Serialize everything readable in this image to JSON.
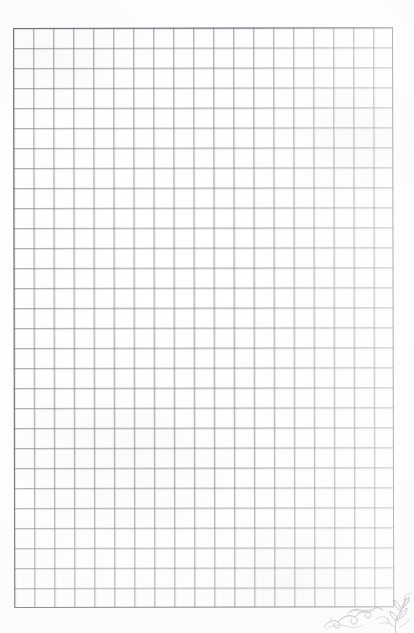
{
  "document": {
    "kind": "scanned-graph-paper",
    "title": "Blank quadrille graph paper sheet",
    "page_width_px": 414,
    "page_height_px": 633,
    "background_color": "#fefefe",
    "content_text": ""
  },
  "grid": {
    "label": "ruled square grid",
    "columns": 19,
    "rows": 29,
    "cell_size_px": 20,
    "left_px": 13,
    "top_px": 28,
    "width_px": 380,
    "height_px": 580,
    "line_color": "#787e88",
    "border_color": "#6e747e",
    "line_opacity": "0.55"
  },
  "margins": {
    "top_label": "top margin",
    "left_label": "left margin",
    "right_label": "right margin",
    "bottom_label": "bottom margin"
  },
  "ornament": {
    "label": "decorative pencil flourish",
    "position": "bottom-right corner",
    "stroke_color": "#5d6470",
    "description": "faint hand-drawn scrollwork and foliate curls"
  }
}
